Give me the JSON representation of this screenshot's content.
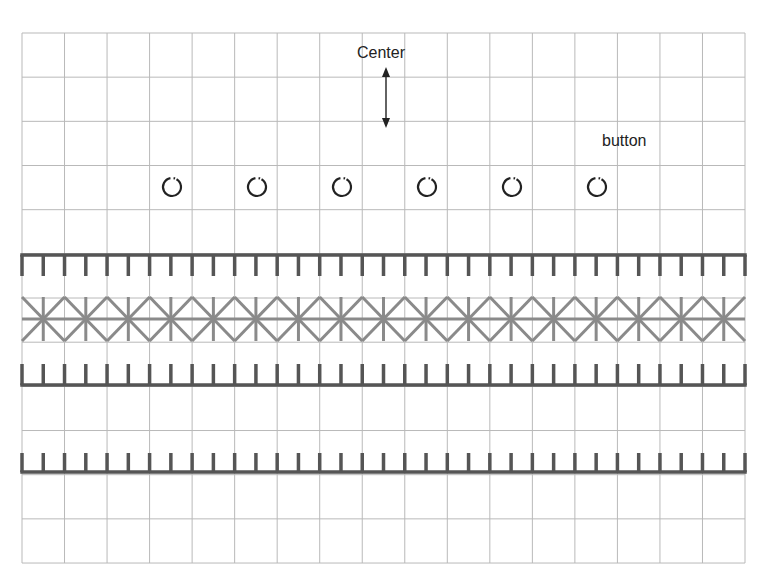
{
  "labels": {
    "center": "Center",
    "button": "button"
  },
  "grid": {
    "left": 22,
    "top": 33,
    "columns": 17,
    "rows": 12,
    "cell_width": 42.53,
    "cell_height": 44.17,
    "color": "#b9b9b9"
  },
  "arrow": {
    "x": 386,
    "y1": 67,
    "y2": 128,
    "color": "#222222"
  },
  "buttons": {
    "count": 6,
    "start_x": 172,
    "spacing": 85,
    "y": 187,
    "radius": 9,
    "color": "#222222"
  },
  "bands": [
    {
      "type": "comb-down",
      "bar_y": 255,
      "tooth_end_y": 276,
      "color": "#555555"
    },
    {
      "type": "cross-stitch",
      "top_y": 297,
      "bottom_y": 341,
      "color": "#8a8a8a"
    },
    {
      "type": "comb-up",
      "bar_y": 385,
      "tooth_end_y": 364,
      "color": "#555555"
    },
    {
      "type": "comb-up",
      "bar_y": 472,
      "tooth_end_y": 453,
      "color": "#555555"
    }
  ]
}
